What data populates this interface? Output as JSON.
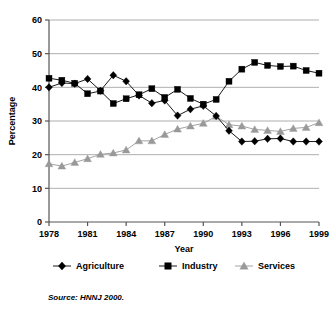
{
  "chart_data": {
    "type": "line",
    "title": "",
    "xlabel": "Year",
    "ylabel": "Percentage",
    "xlim": [
      1978,
      1999
    ],
    "ylim": [
      0,
      60
    ],
    "ytick_step": 10,
    "yticks": [
      "0",
      "10",
      "20",
      "30",
      "40",
      "50",
      "60"
    ],
    "xticks": [
      "1978",
      "1981",
      "1984",
      "1987",
      "1990",
      "1993",
      "1996",
      "1999"
    ],
    "x": [
      1978,
      1979,
      1980,
      1981,
      1982,
      1983,
      1984,
      1985,
      1986,
      1987,
      1988,
      1989,
      1990,
      1991,
      1992,
      1993,
      1994,
      1995,
      1996,
      1997,
      1998,
      1999
    ],
    "grid": "horizontal",
    "legend_position": "bottom",
    "series": [
      {
        "name": "Agriculture",
        "marker": "diamond",
        "color": "#000000",
        "values": [
          40.0,
          41.3,
          41.1,
          42.5,
          39.0,
          43.6,
          41.8,
          37.6,
          35.3,
          36.1,
          31.6,
          33.5,
          34.5,
          31.5,
          27.1,
          23.9,
          24.0,
          24.7,
          24.8,
          23.9,
          23.9,
          23.9
        ]
      },
      {
        "name": "Industry",
        "marker": "square",
        "color": "#000000",
        "values": [
          42.7,
          42.1,
          41.2,
          38.1,
          38.9,
          35.2,
          36.6,
          37.8,
          39.6,
          37.0,
          39.4,
          36.7,
          35.0,
          36.4,
          41.8,
          45.4,
          47.4,
          46.5,
          46.2,
          46.3,
          45.0,
          44.2
        ]
      },
      {
        "name": "Services",
        "marker": "triangle",
        "color": "#999999",
        "values": [
          17.3,
          16.6,
          17.7,
          18.8,
          20.1,
          20.5,
          21.4,
          24.1,
          24.1,
          26.0,
          27.6,
          28.5,
          29.3,
          31.4,
          28.9,
          28.5,
          27.5,
          27.2,
          26.9,
          27.8,
          28.1,
          29.5
        ]
      }
    ]
  },
  "figure": {
    "source_note": "Source:  HNNJ 2000."
  }
}
